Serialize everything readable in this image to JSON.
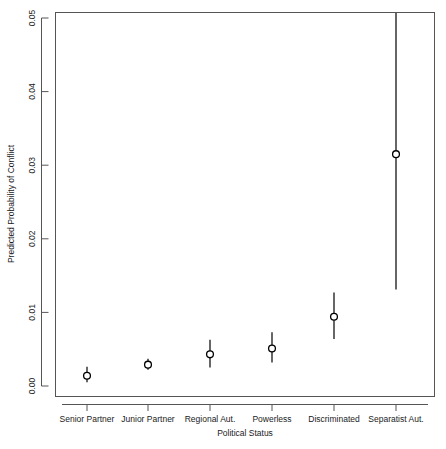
{
  "chart_data": {
    "type": "scatter",
    "title": "",
    "xlabel": "Political Status",
    "ylabel": "Predicted Probability of Conflict",
    "categories": [
      "Senior Partner",
      "Junior Partner",
      "Regional Aut.",
      "Powerless",
      "Discriminated",
      "Separatist Aut."
    ],
    "values": [
      0.0014,
      0.0029,
      0.0043,
      0.0051,
      0.0094,
      0.0315
    ],
    "error_low": [
      0.0005,
      0.0022,
      0.0025,
      0.0032,
      0.0064,
      0.0131
    ],
    "error_high": [
      0.0026,
      0.0037,
      0.0063,
      0.0073,
      0.0127,
      0.052
    ],
    "ylim": [
      -0.0013,
      0.0527
    ],
    "yticks": [
      0.0,
      0.01,
      0.02,
      0.03,
      0.04,
      0.05
    ],
    "ytick_labels": [
      "0.00",
      "0.01",
      "0.02",
      "0.03",
      "0.04",
      "0.05"
    ],
    "grid": false,
    "legend": "none",
    "marker": "open-circle",
    "series_name": "Predicted Probability"
  },
  "axis": {
    "y_title": "Predicted Probability of Conflict",
    "x_title": "Political Status",
    "tick_00": "0.00",
    "tick_01": "0.01",
    "tick_02": "0.02",
    "tick_03": "0.03",
    "tick_04": "0.04",
    "tick_05": "0.05"
  },
  "categories": {
    "c0": "Senior Partner",
    "c1": "Junior Partner",
    "c2": "Regional Aut.",
    "c3": "Powerless",
    "c4": "Discriminated",
    "c5": "Separatist Aut."
  },
  "colors": {
    "line": "#000000",
    "axis": "#4d4d4d",
    "background": "#ffffff"
  }
}
